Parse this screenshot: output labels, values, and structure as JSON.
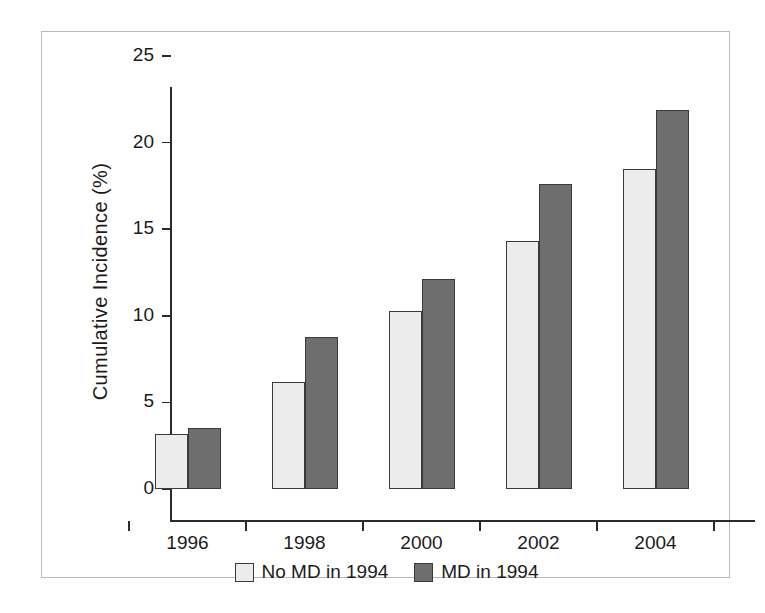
{
  "chart_data": {
    "type": "bar",
    "title": "",
    "subtitle": "",
    "xlabel": "",
    "ylabel": "Cumulative Incidence  (%)",
    "categories": [
      "1996",
      "1998",
      "2000",
      "2002",
      "2004"
    ],
    "series": [
      {
        "name": "No MD in 1994",
        "color": "#ececec",
        "values": [
          3.2,
          6.2,
          10.3,
          14.3,
          18.5
        ]
      },
      {
        "name": "MD in 1994",
        "color": "#6e6e6e",
        "values": [
          3.5,
          8.8,
          12.1,
          17.6,
          21.9
        ]
      }
    ],
    "ylim": [
      0,
      25
    ],
    "ytick_labels": [
      "0",
      "5",
      "10",
      "15",
      "20",
      "25"
    ],
    "ytick_values": [
      0,
      5,
      10,
      15,
      20,
      25
    ],
    "grid": false,
    "legend_position": "bottom"
  },
  "axes": {
    "y_title": "Cumulative Incidence  (%)"
  },
  "legend": {
    "entries": [
      {
        "label": "No MD in 1994",
        "swatch": "light-swatch"
      },
      {
        "label": "MD in 1994",
        "swatch": "dark-swatch"
      }
    ]
  },
  "colors": {
    "bar_light": "#ececec",
    "bar_dark": "#6e6e6e",
    "bar_outline": "#3a3a3a",
    "axis": "#2b2b2b",
    "frame": "#b9b9b9",
    "text": "#1b1b1b",
    "background": "#ffffff"
  }
}
